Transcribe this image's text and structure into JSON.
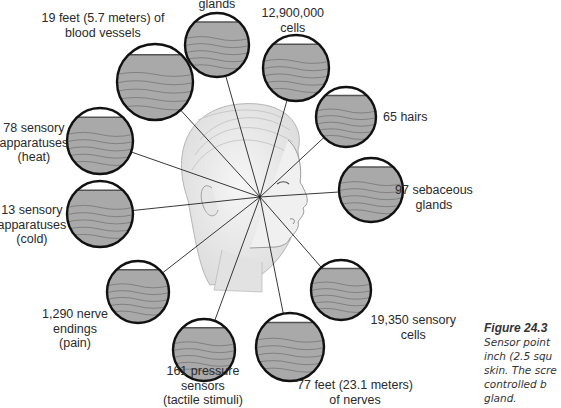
{
  "figure": {
    "number": "Figure 24.3",
    "caption_lines": [
      "Sensor point",
      "inch (2.5 squ",
      "skin. The scre",
      "controlled b",
      "gland."
    ]
  },
  "center_point": {
    "x": 260,
    "y": 197
  },
  "callouts": [
    {
      "id": "sweat-glands",
      "lines": [
        "glands"
      ],
      "circle": {
        "cx": 217,
        "cy": 45,
        "r": 32
      },
      "label_pos": {
        "x": 217,
        "y": -3
      }
    },
    {
      "id": "blood-vessels",
      "lines": [
        "19 feet (5.7 meters) of",
        "blood vessels"
      ],
      "circle": {
        "cx": 155,
        "cy": 82,
        "r": 38
      },
      "label_pos": {
        "x": 103,
        "y": 11
      }
    },
    {
      "id": "cells",
      "lines": [
        "12,900,000",
        "cells"
      ],
      "circle": {
        "cx": 296,
        "cy": 68,
        "r": 33
      },
      "label_pos": {
        "x": 293,
        "y": 6
      }
    },
    {
      "id": "hairs",
      "lines": [
        "65 hairs"
      ],
      "circle": {
        "cx": 346,
        "cy": 117,
        "r": 30
      },
      "label_pos": {
        "x": 405,
        "y": 110
      }
    },
    {
      "id": "sebaceous-glands",
      "lines": [
        "97 sebaceous",
        "glands"
      ],
      "circle": {
        "cx": 371,
        "cy": 190,
        "r": 32
      },
      "label_pos": {
        "x": 434,
        "y": 183
      }
    },
    {
      "id": "sensory-cells",
      "lines": [
        "19,350 sensory",
        "cells"
      ],
      "circle": {
        "cx": 341,
        "cy": 290,
        "r": 30
      },
      "label_pos": {
        "x": 413,
        "y": 313
      }
    },
    {
      "id": "nerves",
      "lines": [
        "77 feet (23.1 meters)",
        "of nerves"
      ],
      "circle": {
        "cx": 290,
        "cy": 347,
        "r": 34
      },
      "label_pos": {
        "x": 355,
        "y": 378
      }
    },
    {
      "id": "pressure-sensors",
      "lines": [
        "161 pressure",
        "sensors",
        "(tactile stimuli)"
      ],
      "circle": {
        "cx": 204,
        "cy": 350,
        "r": 31
      },
      "label_pos": {
        "x": 203,
        "y": 364
      }
    },
    {
      "id": "nerve-endings",
      "lines": [
        "1,290 nerve",
        "endings",
        "(pain)"
      ],
      "circle": {
        "cx": 138,
        "cy": 292,
        "r": 31
      },
      "label_pos": {
        "x": 75,
        "y": 307
      }
    },
    {
      "id": "cold-sensors",
      "lines": [
        "13 sensory",
        "apparatuses",
        "(cold)"
      ],
      "circle": {
        "cx": 100,
        "cy": 214,
        "r": 33
      },
      "label_pos": {
        "x": 32,
        "y": 203
      }
    },
    {
      "id": "heat-sensors",
      "lines": [
        "78 sensory",
        "apparatuses",
        "(heat)"
      ],
      "circle": {
        "cx": 100,
        "cy": 141,
        "r": 33
      },
      "label_pos": {
        "x": 34,
        "y": 121
      }
    }
  ],
  "colors": {
    "circle_fill": "#a9a9a9",
    "circle_stroke": "#111111",
    "line": "#222222",
    "face_fill": "#ececec",
    "face_stroke": "#9a9a9a"
  }
}
